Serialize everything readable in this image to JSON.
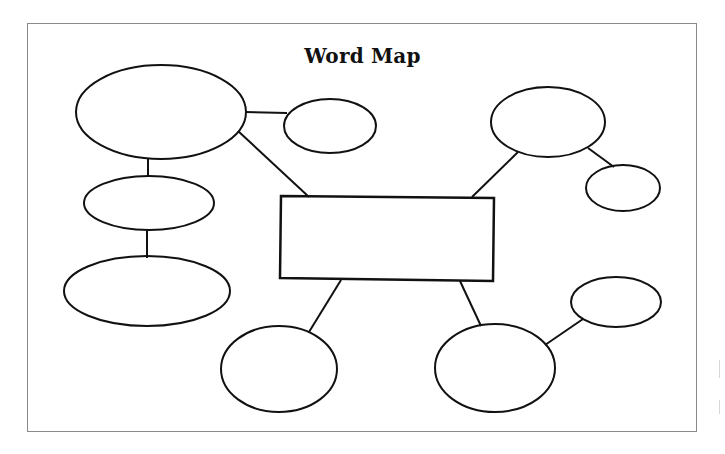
{
  "title": "Word Map",
  "colors": {
    "stroke": "#111111",
    "frame": "#8a8a8a",
    "background": "#ffffff"
  },
  "center_box": {
    "label": "",
    "shape": "rectangle"
  },
  "nodes": [
    {
      "id": "top-left-large",
      "shape": "ellipse",
      "label": ""
    },
    {
      "id": "top-left-small",
      "shape": "ellipse",
      "label": ""
    },
    {
      "id": "middle-left",
      "shape": "ellipse",
      "label": ""
    },
    {
      "id": "bottom-left",
      "shape": "ellipse",
      "label": ""
    },
    {
      "id": "top-right",
      "shape": "ellipse",
      "label": ""
    },
    {
      "id": "top-right-small",
      "shape": "ellipse",
      "label": ""
    },
    {
      "id": "bottom-center-left",
      "shape": "ellipse",
      "label": ""
    },
    {
      "id": "bottom-center-right",
      "shape": "ellipse",
      "label": ""
    },
    {
      "id": "bottom-right-small",
      "shape": "ellipse",
      "label": ""
    }
  ],
  "edges": [
    [
      "top-left-large",
      "top-left-small"
    ],
    [
      "top-left-large",
      "center"
    ],
    [
      "top-left-large",
      "middle-left"
    ],
    [
      "middle-left",
      "bottom-left"
    ],
    [
      "top-right",
      "center"
    ],
    [
      "top-right",
      "top-right-small"
    ],
    [
      "bottom-center-left",
      "center"
    ],
    [
      "bottom-center-right",
      "center"
    ],
    [
      "bottom-center-right",
      "bottom-right-small"
    ]
  ]
}
